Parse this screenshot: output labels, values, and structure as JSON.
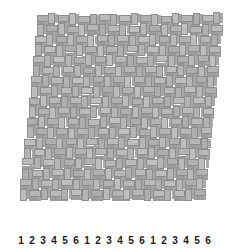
{
  "figure": {
    "background_color": "#ffffff",
    "width": 239,
    "height": 251
  },
  "axes": {
    "x": {
      "tick_labels": [
        "1",
        "2",
        "3",
        "4",
        "5",
        "6",
        "1",
        "2",
        "3",
        "4",
        "5",
        "6",
        "1",
        "2",
        "3",
        "4",
        "5",
        "6"
      ],
      "label": "",
      "tick_label_color": "#1a1a1a"
    },
    "y": {
      "tick_labels": [],
      "label": ""
    },
    "z": {
      "tick_labels": [],
      "label": ""
    }
  },
  "colors": {
    "bar_top": "#b6b6b6",
    "bar_front": "#9c9c9c",
    "bar_side": "#a8a8a8",
    "bar_edge": "#8e8e8e",
    "background": "#ffffff",
    "text": "#1a1a1a"
  },
  "chart_data": {
    "type": "bar",
    "style": "bar3-dense-grid",
    "title": "",
    "xlabel": "",
    "ylabel": "",
    "zlabel": "",
    "grid": false,
    "legend": null,
    "view": "3d-elevated",
    "n_columns": 18,
    "n_rows": 18,
    "categories": [
      "1",
      "2",
      "3",
      "4",
      "5",
      "6",
      "1",
      "2",
      "3",
      "4",
      "5",
      "6",
      "1",
      "2",
      "3",
      "4",
      "5",
      "6"
    ],
    "zlim": [
      0,
      1.2
    ],
    "note": "Dense 3D bar field; all bars have near-uniform height (~1.0) producing a woven basketweave appearance.",
    "series": [
      {
        "name": "row-1",
        "values": [
          1.0,
          1.05,
          1.0,
          1.02,
          0.98,
          1.0,
          1.04,
          1.0,
          0.99,
          1.03,
          1.0,
          1.01,
          0.97,
          1.05,
          1.0,
          1.02,
          1.0,
          1.06
        ]
      },
      {
        "name": "row-2",
        "values": [
          1.02,
          1.0,
          1.03,
          0.99,
          1.01,
          1.04,
          1.0,
          1.02,
          1.0,
          0.98,
          1.03,
          1.0,
          1.01,
          1.0,
          1.04,
          0.99,
          1.02,
          1.0
        ]
      },
      {
        "name": "row-3",
        "values": [
          0.99,
          1.03,
          1.0,
          1.01,
          1.0,
          0.98,
          1.02,
          1.0,
          1.04,
          1.0,
          0.99,
          1.02,
          1.0,
          1.03,
          0.98,
          1.01,
          1.0,
          1.02
        ]
      },
      {
        "name": "row-4",
        "values": [
          1.04,
          1.0,
          0.98,
          1.02,
          1.03,
          1.0,
          0.99,
          1.01,
          1.0,
          1.02,
          1.04,
          1.0,
          0.98,
          1.0,
          1.02,
          1.03,
          0.99,
          1.01
        ]
      },
      {
        "name": "row-5",
        "values": [
          1.0,
          1.01,
          1.02,
          1.0,
          0.99,
          1.03,
          1.0,
          1.04,
          1.02,
          1.0,
          0.98,
          1.01,
          1.03,
          1.0,
          1.0,
          1.02,
          1.04,
          1.0
        ]
      },
      {
        "name": "row-6",
        "values": [
          1.01,
          0.99,
          1.0,
          1.03,
          1.02,
          1.0,
          1.01,
          1.0,
          0.98,
          1.04,
          1.0,
          1.02,
          1.0,
          1.01,
          1.03,
          1.0,
          0.99,
          1.02
        ]
      },
      {
        "name": "row-7",
        "values": [
          1.03,
          1.02,
          1.0,
          0.98,
          1.0,
          1.01,
          1.04,
          1.0,
          1.02,
          1.0,
          1.03,
          0.99,
          1.0,
          1.02,
          1.0,
          1.01,
          1.04,
          1.0
        ]
      },
      {
        "name": "row-8",
        "values": [
          1.0,
          1.0,
          1.04,
          1.01,
          1.02,
          0.99,
          1.0,
          1.03,
          1.0,
          1.01,
          1.0,
          1.04,
          1.02,
          1.0,
          0.98,
          1.03,
          1.0,
          1.01
        ]
      },
      {
        "name": "row-9",
        "values": [
          0.98,
          1.04,
          1.01,
          1.0,
          1.03,
          1.02,
          1.0,
          1.0,
          1.01,
          1.04,
          0.99,
          1.0,
          1.02,
          1.03,
          1.0,
          1.0,
          1.01,
          1.03
        ]
      },
      {
        "name": "row-10",
        "values": [
          1.02,
          1.0,
          0.99,
          1.04,
          1.0,
          1.01,
          1.03,
          1.02,
          1.0,
          0.98,
          1.01,
          1.03,
          1.0,
          1.0,
          1.04,
          1.02,
          1.0,
          0.99
        ]
      },
      {
        "name": "row-11",
        "values": [
          1.0,
          1.03,
          1.02,
          1.0,
          1.01,
          1.0,
          0.98,
          1.04,
          1.03,
          1.0,
          1.02,
          1.0,
          1.01,
          0.99,
          1.0,
          1.04,
          1.02,
          1.0
        ]
      },
      {
        "name": "row-12",
        "values": [
          1.04,
          1.01,
          1.0,
          1.02,
          0.99,
          1.03,
          1.02,
          1.0,
          1.0,
          1.01,
          1.04,
          0.98,
          1.03,
          1.02,
          1.0,
          1.0,
          1.01,
          1.04
        ]
      },
      {
        "name": "row-13",
        "values": [
          1.0,
          1.02,
          1.03,
          1.0,
          1.04,
          1.0,
          1.01,
          0.99,
          1.02,
          1.03,
          1.0,
          1.01,
          1.0,
          1.04,
          1.02,
          0.98,
          1.03,
          1.0
        ]
      },
      {
        "name": "row-14",
        "values": [
          1.01,
          1.0,
          1.0,
          1.03,
          1.02,
          1.04,
          1.0,
          1.02,
          1.01,
          1.0,
          0.99,
          1.03,
          1.04,
          1.0,
          1.0,
          1.02,
          1.0,
          1.01
        ]
      },
      {
        "name": "row-15",
        "values": [
          1.03,
          1.04,
          1.01,
          1.0,
          1.0,
          1.02,
          1.03,
          1.0,
          0.98,
          1.02,
          1.01,
          1.0,
          1.0,
          1.03,
          1.04,
          1.0,
          1.02,
          1.0
        ]
      },
      {
        "name": "row-16",
        "values": [
          1.0,
          1.0,
          1.02,
          1.04,
          1.01,
          1.0,
          1.0,
          1.03,
          1.02,
          1.0,
          1.04,
          1.02,
          0.99,
          1.0,
          1.01,
          1.03,
          1.0,
          1.02
        ]
      },
      {
        "name": "row-17",
        "values": [
          1.02,
          1.03,
          1.0,
          1.01,
          1.03,
          1.0,
          1.02,
          1.01,
          1.0,
          1.04,
          1.0,
          1.0,
          1.02,
          1.01,
          1.0,
          1.0,
          1.03,
          1.04
        ]
      },
      {
        "name": "row-18",
        "values": [
          1.0,
          1.01,
          1.04,
          1.0,
          1.02,
          1.03,
          1.0,
          1.0,
          1.03,
          1.01,
          1.02,
          1.04,
          1.0,
          1.02,
          1.0,
          1.01,
          1.0,
          1.03
        ]
      }
    ]
  }
}
